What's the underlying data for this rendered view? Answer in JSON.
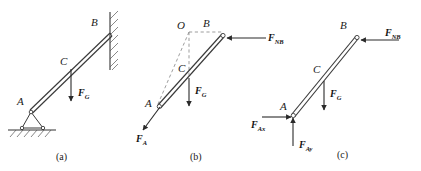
{
  "figure": {
    "background_color": "#ffffff",
    "stroke_color": "#333333",
    "panels": [
      {
        "id": "a",
        "caption": "(a)",
        "description": "Rod AB resting on a pin support at A against a smooth vertical wall at B",
        "points": [
          {
            "name": "A",
            "label": "A"
          },
          {
            "name": "B",
            "label": "B"
          },
          {
            "name": "C",
            "label": "C"
          }
        ],
        "forces": [
          {
            "name": "weight",
            "label": "F",
            "sub": "G",
            "direction": "down",
            "applied_at": "C"
          }
        ],
        "supports": [
          "pin-support-A",
          "wall-B"
        ]
      },
      {
        "id": "b",
        "caption": "(b)",
        "description": "Three-force member construction: lines of action meet at point O",
        "points": [
          {
            "name": "A",
            "label": "A"
          },
          {
            "name": "B",
            "label": "B"
          },
          {
            "name": "C",
            "label": "C"
          },
          {
            "name": "O",
            "label": "O"
          }
        ],
        "forces": [
          {
            "name": "wall-normal",
            "label": "F",
            "sub": "NB",
            "direction": "left",
            "applied_at": "B"
          },
          {
            "name": "weight",
            "label": "F",
            "sub": "G",
            "direction": "down",
            "applied_at": "C"
          },
          {
            "name": "pin-reaction",
            "label": "F",
            "sub": "A",
            "direction": "down-left",
            "applied_at": "A"
          }
        ],
        "construction_lines": [
          "O-B horizontal dashed",
          "O-C vertical dashed",
          "O-A inclined dashed"
        ]
      },
      {
        "id": "c",
        "caption": "(c)",
        "description": "Free-body diagram with pin reaction resolved into rectangular components",
        "points": [
          {
            "name": "A",
            "label": "A"
          },
          {
            "name": "B",
            "label": "B"
          },
          {
            "name": "C",
            "label": "C"
          }
        ],
        "forces": [
          {
            "name": "wall-normal",
            "label": "F",
            "sub": "NB",
            "direction": "left",
            "applied_at": "B"
          },
          {
            "name": "weight",
            "label": "F",
            "sub": "G",
            "direction": "down",
            "applied_at": "C"
          },
          {
            "name": "pin-reaction-x",
            "label": "F",
            "sub": "Ax",
            "direction": "right",
            "applied_at": "A"
          },
          {
            "name": "pin-reaction-y",
            "label": "F",
            "sub": "Ay",
            "direction": "up",
            "applied_at": "A"
          }
        ]
      }
    ]
  },
  "labels": {
    "A": "A",
    "B": "B",
    "C": "C",
    "O": "O",
    "F": "F",
    "sub_G": "G",
    "sub_NB": "NB",
    "sub_A": "A",
    "sub_Ax": "Ax",
    "sub_Ay": "Ay",
    "caption_a": "(a)",
    "caption_b": "(b)",
    "caption_c": "(c)"
  }
}
